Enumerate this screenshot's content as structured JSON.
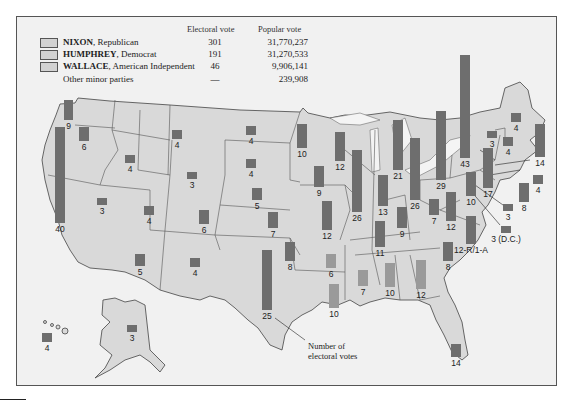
{
  "legend": {
    "header_electoral": "Electoral vote",
    "header_popular": "Popular vote",
    "rows": [
      {
        "candidate": "NIXON",
        "party": ", Republican",
        "electoral": "301",
        "popular": "31,770,237"
      },
      {
        "candidate": "HUMPHREY",
        "party": ", Democrat",
        "electoral": "191",
        "popular": "31,270,533"
      },
      {
        "candidate": "WALLACE",
        "party": ", American Independent",
        "electoral": "46",
        "popular": "9,906,141"
      },
      {
        "candidate": "",
        "party": "Other minor parties",
        "electoral": "—",
        "popular": "239,908"
      }
    ]
  },
  "colors": {
    "map_fill": "#d9d9d9",
    "background": "#f1f1f1",
    "bar_major": "#6e6e6e",
    "bar_wallace": "#9a9a9a",
    "border": "#444444"
  },
  "annotation": {
    "line1": "Number of",
    "line2": "electoral votes"
  },
  "chart_data": {
    "type": "map",
    "unit": "electoral votes per state (bar height proportional)",
    "totals": {
      "Nixon": 301,
      "Humphrey": 191,
      "Wallace": 46
    },
    "states": [
      {
        "state": "WA",
        "votes": 9,
        "label": "9",
        "x": 64,
        "y": 100,
        "w": 9,
        "h": 20,
        "party": "H"
      },
      {
        "state": "OR",
        "votes": 6,
        "label": "6",
        "x": 79,
        "y": 127,
        "w": 10,
        "h": 14,
        "party": "N"
      },
      {
        "state": "CA",
        "votes": 40,
        "label": "40",
        "x": 55,
        "y": 127,
        "w": 10,
        "h": 96,
        "party": "N"
      },
      {
        "state": "ID",
        "votes": 4,
        "label": "4",
        "x": 125,
        "y": 155,
        "w": 10,
        "h": 8,
        "party": "N"
      },
      {
        "state": "MT",
        "votes": 4,
        "label": "4",
        "x": 172,
        "y": 130,
        "w": 10,
        "h": 9,
        "party": "N"
      },
      {
        "state": "NV",
        "votes": 3,
        "label": "3",
        "x": 97,
        "y": 198,
        "w": 10,
        "h": 7,
        "party": "N"
      },
      {
        "state": "UT",
        "votes": 4,
        "label": "4",
        "x": 144,
        "y": 206,
        "w": 10,
        "h": 9,
        "party": "N"
      },
      {
        "state": "WY",
        "votes": 3,
        "label": "3",
        "x": 187,
        "y": 172,
        "w": 10,
        "h": 7,
        "party": "N"
      },
      {
        "state": "AZ",
        "votes": 5,
        "label": "5",
        "x": 135,
        "y": 254,
        "w": 10,
        "h": 12,
        "party": "N"
      },
      {
        "state": "CO",
        "votes": 6,
        "label": "6",
        "x": 199,
        "y": 210,
        "w": 10,
        "h": 14,
        "party": "N"
      },
      {
        "state": "NM",
        "votes": 4,
        "label": "4",
        "x": 190,
        "y": 258,
        "w": 10,
        "h": 9,
        "party": "N"
      },
      {
        "state": "ND",
        "votes": 4,
        "label": "4",
        "x": 246,
        "y": 126,
        "w": 10,
        "h": 9,
        "party": "N"
      },
      {
        "state": "SD",
        "votes": 4,
        "label": "4",
        "x": 246,
        "y": 159,
        "w": 10,
        "h": 9,
        "party": "N"
      },
      {
        "state": "NE",
        "votes": 5,
        "label": "5",
        "x": 252,
        "y": 188,
        "w": 10,
        "h": 12,
        "party": "N"
      },
      {
        "state": "KS",
        "votes": 7,
        "label": "7",
        "x": 268,
        "y": 212,
        "w": 10,
        "h": 16,
        "party": "N"
      },
      {
        "state": "OK",
        "votes": 8,
        "label": "8",
        "x": 285,
        "y": 242,
        "w": 10,
        "h": 19,
        "party": "N"
      },
      {
        "state": "TX",
        "votes": 25,
        "label": "25",
        "x": 262,
        "y": 250,
        "w": 10,
        "h": 60,
        "party": "H"
      },
      {
        "state": "MN",
        "votes": 10,
        "label": "10",
        "x": 297,
        "y": 124,
        "w": 10,
        "h": 24,
        "party": "H"
      },
      {
        "state": "IA",
        "votes": 9,
        "label": "9",
        "x": 314,
        "y": 166,
        "w": 10,
        "h": 21,
        "party": "N"
      },
      {
        "state": "MO",
        "votes": 12,
        "label": "12",
        "x": 322,
        "y": 201,
        "w": 10,
        "h": 29,
        "party": "N"
      },
      {
        "state": "AR",
        "votes": 6,
        "label": "6",
        "x": 326,
        "y": 254,
        "w": 10,
        "h": 14,
        "party": "W"
      },
      {
        "state": "LA",
        "votes": 10,
        "label": "10",
        "x": 329,
        "y": 284,
        "w": 10,
        "h": 24,
        "party": "W"
      },
      {
        "state": "WI",
        "votes": 12,
        "label": "12",
        "x": 335,
        "y": 132,
        "w": 10,
        "h": 29,
        "party": "N"
      },
      {
        "state": "IL",
        "votes": 26,
        "label": "26",
        "x": 352,
        "y": 150,
        "w": 10,
        "h": 62,
        "party": "N"
      },
      {
        "state": "MS",
        "votes": 7,
        "label": "7",
        "x": 358,
        "y": 270,
        "w": 10,
        "h": 16,
        "party": "W"
      },
      {
        "state": "MI",
        "votes": 21,
        "label": "21",
        "x": 393,
        "y": 120,
        "w": 10,
        "h": 50,
        "party": "H"
      },
      {
        "state": "IN",
        "votes": 13,
        "label": "13",
        "x": 378,
        "y": 175,
        "w": 10,
        "h": 31,
        "party": "N"
      },
      {
        "state": "KY",
        "votes": 9,
        "label": "9",
        "x": 397,
        "y": 207,
        "w": 10,
        "h": 21,
        "party": "N"
      },
      {
        "state": "TN",
        "votes": 11,
        "label": "11",
        "x": 375,
        "y": 221,
        "w": 10,
        "h": 26,
        "party": "N"
      },
      {
        "state": "AL",
        "votes": 10,
        "label": "10",
        "x": 385,
        "y": 263,
        "w": 10,
        "h": 24,
        "party": "W"
      },
      {
        "state": "GA",
        "votes": 12,
        "label": "12",
        "x": 416,
        "y": 260,
        "w": 10,
        "h": 29,
        "party": "W"
      },
      {
        "state": "OH",
        "votes": 26,
        "label": "26",
        "x": 410,
        "y": 138,
        "w": 10,
        "h": 62,
        "party": "N"
      },
      {
        "state": "WV",
        "votes": 7,
        "label": "7",
        "x": 429,
        "y": 199,
        "w": 10,
        "h": 16,
        "party": "H"
      },
      {
        "state": "PA",
        "votes": 29,
        "label": "29",
        "x": 436,
        "y": 111,
        "w": 10,
        "h": 69,
        "party": "H"
      },
      {
        "state": "VA",
        "votes": 12,
        "label": "12",
        "x": 446,
        "y": 192,
        "w": 10,
        "h": 29,
        "party": "N"
      },
      {
        "state": "NC",
        "votes": 13,
        "label": "12-R/1-A",
        "x": 466,
        "y": 216,
        "w": 10,
        "h": 28,
        "party": "N"
      },
      {
        "state": "SC",
        "votes": 8,
        "label": "8",
        "x": 443,
        "y": 242,
        "w": 10,
        "h": 19,
        "party": "N"
      },
      {
        "state": "FL",
        "votes": 14,
        "label": "14",
        "x": 451,
        "y": 344,
        "w": 10,
        "h": 13,
        "party": "N"
      },
      {
        "state": "NY",
        "votes": 43,
        "label": "43",
        "x": 460,
        "y": 55,
        "w": 10,
        "h": 103,
        "party": "H"
      },
      {
        "state": "MD",
        "votes": 10,
        "label": "10",
        "x": 466,
        "y": 172,
        "w": 10,
        "h": 24,
        "party": "H"
      },
      {
        "state": "NJ",
        "votes": 17,
        "label": "17",
        "x": 483,
        "y": 148,
        "w": 10,
        "h": 40,
        "party": "N"
      },
      {
        "state": "DE",
        "votes": 3,
        "label": "3",
        "x": 503,
        "y": 204,
        "w": 10,
        "h": 7,
        "party": "N"
      },
      {
        "state": "DC",
        "votes": 3,
        "label": "3 (D.C.)",
        "x": 501,
        "y": 226,
        "w": 10,
        "h": 7,
        "party": "H"
      },
      {
        "state": "VT",
        "votes": 3,
        "label": "3",
        "x": 487,
        "y": 131,
        "w": 10,
        "h": 7,
        "party": "N"
      },
      {
        "state": "NH",
        "votes": 4,
        "label": "4",
        "x": 503,
        "y": 137,
        "w": 10,
        "h": 9,
        "party": "N"
      },
      {
        "state": "ME",
        "votes": 4,
        "label": "4",
        "x": 511,
        "y": 113,
        "w": 10,
        "h": 9,
        "party": "H"
      },
      {
        "state": "MA",
        "votes": 14,
        "label": "14",
        "x": 535,
        "y": 124,
        "w": 10,
        "h": 33,
        "party": "H"
      },
      {
        "state": "RI",
        "votes": 4,
        "label": "4",
        "x": 533,
        "y": 175,
        "w": 10,
        "h": 9,
        "party": "H"
      },
      {
        "state": "CT",
        "votes": 8,
        "label": "8",
        "x": 519,
        "y": 183,
        "w": 10,
        "h": 19,
        "party": "H"
      },
      {
        "state": "AK",
        "votes": 3,
        "label": "3",
        "x": 127,
        "y": 325,
        "w": 10,
        "h": 7,
        "party": "N"
      },
      {
        "state": "HI",
        "votes": 4,
        "label": "4",
        "x": 42,
        "y": 333,
        "w": 10,
        "h": 9,
        "party": "H"
      }
    ]
  }
}
